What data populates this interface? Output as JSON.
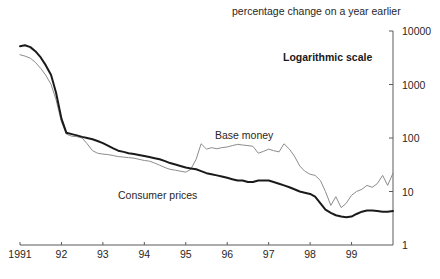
{
  "chart_data": {
    "type": "line",
    "title": "",
    "subtitle": "percentage change on a year earlier",
    "annotation_scale": "Logarithmic scale",
    "xlabel": "",
    "ylabel": "",
    "scale": "log",
    "ylim": [
      1,
      10000
    ],
    "ytick_labels": [
      "10000",
      "1000",
      "100",
      "10",
      "1"
    ],
    "ytick_values": [
      10000,
      1000,
      100,
      10,
      1
    ],
    "xtick_labels": [
      "1991",
      "92",
      "93",
      "94",
      "95",
      "96",
      "97",
      "98",
      "99"
    ],
    "xtick_values": [
      1991,
      1992,
      1993,
      1994,
      1995,
      1996,
      1997,
      1998,
      1999
    ],
    "xlim": [
      1991,
      2000
    ],
    "grid": false,
    "legend": "inline-labels",
    "axis_position": "right",
    "colors": {
      "base_money": "#8c8c8c",
      "consumer_prices": "#1a1a1a",
      "axis": "#5a5a5a",
      "text": "#2a2624",
      "background": "#ffffff"
    },
    "series": [
      {
        "name": "Base money",
        "color": "#8c8c8c",
        "line_width": 1.0,
        "points": [
          [
            1991.0,
            3600
          ],
          [
            1991.12,
            3400
          ],
          [
            1991.25,
            3100
          ],
          [
            1991.37,
            2600
          ],
          [
            1991.5,
            2000
          ],
          [
            1991.62,
            1500
          ],
          [
            1991.75,
            1000
          ],
          [
            1991.87,
            520
          ],
          [
            1992.0,
            200
          ],
          [
            1992.12,
            118
          ],
          [
            1992.25,
            108
          ],
          [
            1992.37,
            106
          ],
          [
            1992.5,
            100
          ],
          [
            1992.62,
            78
          ],
          [
            1992.75,
            58
          ],
          [
            1992.87,
            52
          ],
          [
            1993.0,
            50
          ],
          [
            1993.12,
            49
          ],
          [
            1993.25,
            47
          ],
          [
            1993.37,
            45
          ],
          [
            1993.5,
            44
          ],
          [
            1993.62,
            43
          ],
          [
            1993.75,
            42
          ],
          [
            1993.87,
            40
          ],
          [
            1994.0,
            38
          ],
          [
            1994.12,
            37
          ],
          [
            1994.25,
            34
          ],
          [
            1994.37,
            31
          ],
          [
            1994.5,
            28
          ],
          [
            1994.62,
            26
          ],
          [
            1994.75,
            25
          ],
          [
            1994.87,
            24
          ],
          [
            1995.0,
            23
          ],
          [
            1995.12,
            26
          ],
          [
            1995.25,
            40
          ],
          [
            1995.37,
            78
          ],
          [
            1995.5,
            62
          ],
          [
            1995.62,
            66
          ],
          [
            1995.75,
            63
          ],
          [
            1995.87,
            66
          ],
          [
            1996.0,
            68
          ],
          [
            1996.12,
            72
          ],
          [
            1996.25,
            76
          ],
          [
            1996.37,
            74
          ],
          [
            1996.5,
            72
          ],
          [
            1996.62,
            70
          ],
          [
            1996.75,
            52
          ],
          [
            1996.87,
            56
          ],
          [
            1997.0,
            62
          ],
          [
            1997.12,
            58
          ],
          [
            1997.25,
            55
          ],
          [
            1997.37,
            78
          ],
          [
            1997.5,
            62
          ],
          [
            1997.62,
            46
          ],
          [
            1997.75,
            30
          ],
          [
            1997.87,
            24
          ],
          [
            1998.0,
            21
          ],
          [
            1998.12,
            20
          ],
          [
            1998.25,
            16
          ],
          [
            1998.37,
            10
          ],
          [
            1998.5,
            5.5
          ],
          [
            1998.62,
            8
          ],
          [
            1998.75,
            5.0
          ],
          [
            1998.87,
            6.0
          ],
          [
            1999.0,
            8.5
          ],
          [
            1999.12,
            10
          ],
          [
            1999.25,
            11
          ],
          [
            1999.37,
            13
          ],
          [
            1999.5,
            12
          ],
          [
            1999.62,
            14
          ],
          [
            1999.75,
            20
          ],
          [
            1999.87,
            13
          ],
          [
            2000.0,
            22
          ]
        ]
      },
      {
        "name": "Consumer prices",
        "color": "#1a1a1a",
        "line_width": 2.0,
        "points": [
          [
            1991.0,
            5200
          ],
          [
            1991.12,
            5400
          ],
          [
            1991.25,
            5000
          ],
          [
            1991.37,
            4200
          ],
          [
            1991.5,
            3200
          ],
          [
            1991.62,
            2300
          ],
          [
            1991.75,
            1500
          ],
          [
            1991.87,
            700
          ],
          [
            1992.0,
            230
          ],
          [
            1992.12,
            125
          ],
          [
            1992.25,
            118
          ],
          [
            1992.37,
            112
          ],
          [
            1992.5,
            105
          ],
          [
            1992.62,
            100
          ],
          [
            1992.75,
            95
          ],
          [
            1992.87,
            88
          ],
          [
            1993.0,
            80
          ],
          [
            1993.12,
            72
          ],
          [
            1993.25,
            64
          ],
          [
            1993.37,
            58
          ],
          [
            1993.5,
            55
          ],
          [
            1993.62,
            52
          ],
          [
            1993.75,
            50
          ],
          [
            1993.87,
            48
          ],
          [
            1994.0,
            46
          ],
          [
            1994.12,
            44
          ],
          [
            1994.25,
            42
          ],
          [
            1994.37,
            40
          ],
          [
            1994.5,
            37
          ],
          [
            1994.62,
            34
          ],
          [
            1994.75,
            32
          ],
          [
            1994.87,
            30
          ],
          [
            1995.0,
            28
          ],
          [
            1995.12,
            27
          ],
          [
            1995.25,
            26
          ],
          [
            1995.37,
            24
          ],
          [
            1995.5,
            22
          ],
          [
            1995.62,
            21
          ],
          [
            1995.75,
            20
          ],
          [
            1995.87,
            19
          ],
          [
            1996.0,
            18
          ],
          [
            1996.12,
            17
          ],
          [
            1996.25,
            16
          ],
          [
            1996.37,
            16
          ],
          [
            1996.5,
            15
          ],
          [
            1996.62,
            15
          ],
          [
            1996.75,
            16
          ],
          [
            1996.87,
            16
          ],
          [
            1997.0,
            16
          ],
          [
            1997.12,
            15
          ],
          [
            1997.25,
            14
          ],
          [
            1997.37,
            13
          ],
          [
            1997.5,
            12
          ],
          [
            1997.62,
            11
          ],
          [
            1997.75,
            10
          ],
          [
            1997.87,
            9.5
          ],
          [
            1998.0,
            9.0
          ],
          [
            1998.12,
            8.0
          ],
          [
            1998.25,
            6.0
          ],
          [
            1998.37,
            4.6
          ],
          [
            1998.5,
            4.0
          ],
          [
            1998.62,
            3.6
          ],
          [
            1998.75,
            3.4
          ],
          [
            1998.87,
            3.3
          ],
          [
            1999.0,
            3.4
          ],
          [
            1999.12,
            3.8
          ],
          [
            1999.25,
            4.2
          ],
          [
            1999.37,
            4.4
          ],
          [
            1999.5,
            4.4
          ],
          [
            1999.62,
            4.3
          ],
          [
            1999.75,
            4.2
          ],
          [
            1999.87,
            4.2
          ],
          [
            2000.0,
            4.3
          ]
        ]
      }
    ]
  }
}
